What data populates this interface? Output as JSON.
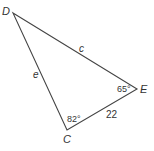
{
  "diagram": {
    "type": "triangle",
    "stroke_color": "#444444",
    "vertices": {
      "D": {
        "label": "D",
        "x": 13,
        "y": 13
      },
      "E": {
        "label": "E",
        "x": 137,
        "y": 89
      },
      "C": {
        "label": "C",
        "x": 67,
        "y": 130
      }
    },
    "sides": {
      "DE": {
        "label": "c"
      },
      "DC": {
        "label": "e"
      },
      "CE": {
        "label": "22"
      }
    },
    "angles": {
      "E": {
        "label": "65°"
      },
      "C": {
        "label": "82°"
      }
    }
  }
}
